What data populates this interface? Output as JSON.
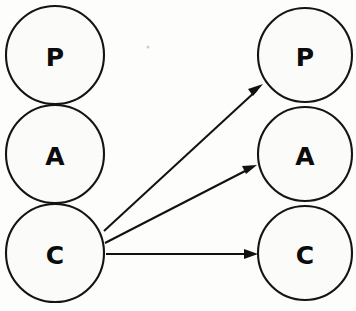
{
  "diagram": {
    "type": "node-link-diagram",
    "background_color": "#fdfdfc",
    "stroke_color": "#141414",
    "label_color": "#0b0b0b",
    "columns": [
      {
        "name": "left-column",
        "nodes": [
          {
            "id": "left-p",
            "label": "P",
            "cx": 55,
            "cy": 55,
            "r": 49
          },
          {
            "id": "left-a",
            "label": "A",
            "cx": 55,
            "cy": 154,
            "r": 49
          },
          {
            "id": "left-c",
            "label": "C",
            "cx": 55,
            "cy": 253,
            "r": 49
          }
        ]
      },
      {
        "name": "right-column",
        "nodes": [
          {
            "id": "right-p",
            "label": "P",
            "cx": 305,
            "cy": 55,
            "r": 47
          },
          {
            "id": "right-a",
            "label": "A",
            "cx": 305,
            "cy": 154,
            "r": 47
          },
          {
            "id": "right-c",
            "label": "C",
            "cx": 305,
            "cy": 253,
            "r": 47
          }
        ]
      }
    ],
    "edges": [
      {
        "id": "edge-c-to-p",
        "from": "left-c",
        "to": "right-p",
        "from_label": "C",
        "to_label": "P",
        "x1": 104,
        "y1": 231,
        "x2": 262,
        "y2": 86,
        "directed": true
      },
      {
        "id": "edge-c-to-a",
        "from": "left-c",
        "to": "right-a",
        "from_label": "C",
        "to_label": "A",
        "x1": 105,
        "y1": 243,
        "x2": 256,
        "y2": 166,
        "directed": true
      },
      {
        "id": "edge-c-to-c",
        "from": "left-c",
        "to": "right-c",
        "from_label": "C",
        "to_label": "C",
        "x1": 106,
        "y1": 254,
        "x2": 257,
        "y2": 254,
        "directed": true
      }
    ],
    "artifacts": [
      {
        "id": "speck",
        "cx": 148,
        "cy": 47,
        "r": 1.6
      }
    ]
  }
}
